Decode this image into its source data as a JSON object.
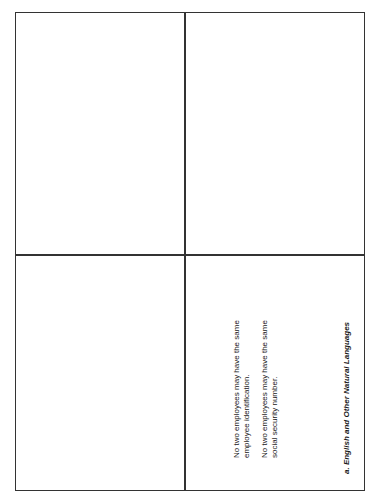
{
  "panels": {
    "a": {
      "caption": "a. English and Other Natural Languages",
      "paragraphs": [
        "No two employees may have the same employee identification.",
        "No two employees may have the same social security number."
      ]
    },
    "b": {
      "caption": "b. Entity-relationship Diagrams",
      "entity": "Employee",
      "attributes": {
        "ssn": "SocialSecurityNumber",
        "address": "Address",
        "empname": "EmpName",
        "empid": "EmpId"
      }
    },
    "c": {
      "caption": "c. SQL",
      "create": "CREATE TABLE Employee",
      "rows": [
        {
          "col": "(EmpId",
          "type": "INTEGER,"
        },
        {
          "col": "EmpName",
          "type": "CHAR(20),"
        },
        {
          "col": "Address",
          "type": "CHAR(40),"
        },
        {
          "col": "SocialSecurityNumber",
          "type": "INTEGER,"
        },
        {
          "col": "PRIMARY KEY",
          "type": "(EmpId)"
        },
        {
          "col": "UNIQUE",
          "type": "(SocialSecurityNumber))"
        }
      ]
    },
    "d": {
      "caption": "d. Relational Diagrams",
      "table": "Employee",
      "fields": {
        "pk": "EmpId",
        "f1": "EmpName",
        "f2": "Address",
        "uq": "SocialSecurityNumber"
      }
    }
  }
}
